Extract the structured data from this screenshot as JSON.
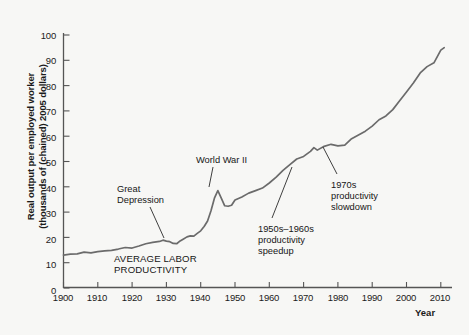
{
  "chart_data": {
    "type": "line",
    "title": "",
    "xlabel": "Year",
    "ylabel": "Real output per employed worker (thousands of (chained) 2005 dollars)",
    "ylabel_line1": "Real output per employed worker",
    "ylabel_line2": "(thousands of (chained) 2005 dollars)",
    "xlim": [
      1900,
      2012
    ],
    "ylim": [
      0,
      104
    ],
    "yticks": [
      0,
      10,
      20,
      30,
      40,
      50,
      60,
      70,
      80,
      90,
      100
    ],
    "xticks": [
      1900,
      1910,
      1920,
      1930,
      1940,
      1950,
      1960,
      1970,
      1980,
      1990,
      2000,
      2010
    ],
    "grid": false,
    "legend": "none",
    "line_color": "#6b6b6b",
    "series": [
      {
        "name": "Average labor productivity",
        "x": [
          1900,
          1902,
          1904,
          1906,
          1908,
          1910,
          1912,
          1914,
          1916,
          1918,
          1920,
          1922,
          1924,
          1926,
          1928,
          1929,
          1930,
          1931,
          1932,
          1933,
          1934,
          1935,
          1936,
          1937,
          1938,
          1939,
          1940,
          1941,
          1942,
          1943,
          1944,
          1945,
          1946,
          1947,
          1948,
          1949,
          1950,
          1952,
          1954,
          1956,
          1958,
          1960,
          1962,
          1964,
          1966,
          1968,
          1970,
          1972,
          1973,
          1974,
          1976,
          1978,
          1980,
          1982,
          1984,
          1986,
          1988,
          1990,
          1992,
          1994,
          1996,
          1998,
          2000,
          2002,
          2004,
          2006,
          2008,
          2010,
          2011
        ],
        "values": [
          13.0,
          13.4,
          13.5,
          14.2,
          13.9,
          14.4,
          14.7,
          14.9,
          15.4,
          16.0,
          15.8,
          16.6,
          17.5,
          18.0,
          18.4,
          18.9,
          18.5,
          18.3,
          17.6,
          17.5,
          18.6,
          19.4,
          20.2,
          20.6,
          20.5,
          21.6,
          22.6,
          24.3,
          26.5,
          30.5,
          35.5,
          38.5,
          35.5,
          32.5,
          32.3,
          32.7,
          34.8,
          36.0,
          37.5,
          38.5,
          39.5,
          41.5,
          43.8,
          46.5,
          48.8,
          51.0,
          52.0,
          54.0,
          55.5,
          54.5,
          56.0,
          56.8,
          56.2,
          56.5,
          59.0,
          60.5,
          62.0,
          64.0,
          66.5,
          68.0,
          70.5,
          74.0,
          77.5,
          81.0,
          85.0,
          87.5,
          89.0,
          94.0,
          95.0
        ]
      }
    ],
    "annotations": [
      {
        "name": "great-depression",
        "text": "Great\nDepression",
        "x": 117,
        "y": 184
      },
      {
        "name": "world-war-ii",
        "text": "World War II",
        "x": 196,
        "y": 155
      },
      {
        "name": "average-labor-productivity",
        "text": "AVERAGE LABOR\nPRODUCTIVITY",
        "x": 114,
        "y": 253
      },
      {
        "name": "productivity-speedup",
        "text": "1950s–1960s\nproductivity\nspeedup",
        "x": 258,
        "y": 224
      },
      {
        "name": "productivity-slowdown",
        "text": "1970s\nproductivity\nslowdown",
        "x": 331,
        "y": 180
      }
    ]
  }
}
